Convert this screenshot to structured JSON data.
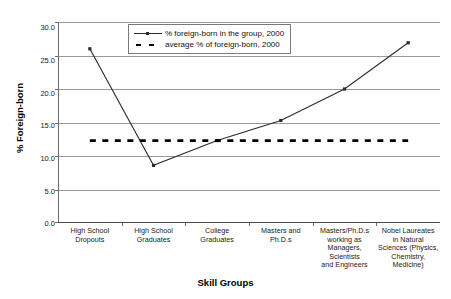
{
  "chart_data": {
    "type": "line",
    "title": "",
    "xlabel": "Skill Groups",
    "ylabel": "% Foreign-born",
    "ylim": [
      0.0,
      30.0
    ],
    "ytick_labels": [
      "0.0",
      "5.0",
      "10.0",
      "15.0",
      "20.0",
      "25.0",
      "30.0"
    ],
    "ytick_values": [
      0.0,
      5.0,
      10.0,
      15.0,
      20.0,
      25.0,
      30.0
    ],
    "grid": true,
    "legend_position": "top-center",
    "categories": [
      "High School Dropouts",
      "High School Graduates",
      "College Graduates",
      "Masters and Ph.D.s",
      "Masters/Ph.D.s working as Managers, Scientists and Engineers",
      "Nobel Laureates in Natural Sciences (Physics, Chemistry, Medicine)"
    ],
    "category_lines": [
      [
        "High School",
        "Dropouts"
      ],
      [
        "High School",
        "Graduates"
      ],
      [
        "College",
        "Graduates"
      ],
      [
        "Masters and",
        "Ph.D.s"
      ],
      [
        "Masters/Ph.D.s",
        "working as",
        "Managers,",
        "Scientists",
        "and Engineers"
      ],
      [
        "Nobel Laureates",
        "in Natural",
        "Sciences (Physics,",
        "Chemistry,",
        "Medicine)"
      ]
    ],
    "series": [
      {
        "name": "% foreign-born in the group, 2000",
        "style": "solid-with-markers",
        "color": "#2b2b2b",
        "values": [
          26.0,
          8.6,
          12.3,
          15.3,
          20.0,
          26.9
        ]
      },
      {
        "name": "average % of foreign-born, 2000",
        "style": "dashed",
        "color": "#000000",
        "constant": 12.3,
        "values": [
          12.3,
          12.3,
          12.3,
          12.3,
          12.3,
          12.3
        ]
      }
    ]
  },
  "legend": {
    "entries": [
      {
        "label": "% foreign-born in the group, 2000"
      },
      {
        "label": "average % of foreign-born, 2000"
      }
    ]
  },
  "axes": {
    "y_title": "% Foreign-born",
    "x_title": "Skill Groups"
  }
}
